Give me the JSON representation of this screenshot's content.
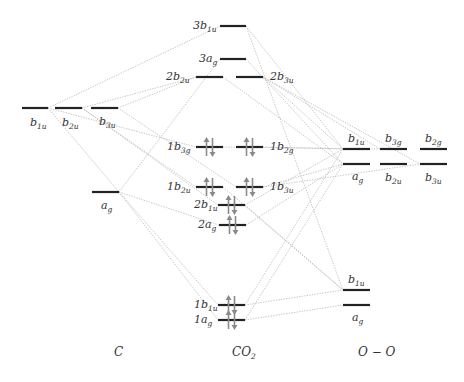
{
  "columns": {
    "left": {
      "title": "C",
      "x": 114,
      "y": 356
    },
    "middle": {
      "title": "CO",
      "title_sub": "2",
      "x": 232,
      "y": 356
    },
    "right": {
      "title": "O − O",
      "x": 358,
      "y": 356
    }
  },
  "levels": [
    {
      "id": "c_b1u",
      "x1": 22,
      "x2": 48,
      "y": 108,
      "label": "b",
      "sub": "1u",
      "lx": 30,
      "ly": 126,
      "electrons": 0
    },
    {
      "id": "c_b2u",
      "x1": 55,
      "x2": 82,
      "y": 108,
      "label": "b",
      "sub": "2u",
      "lx": 62,
      "ly": 126,
      "electrons": 0
    },
    {
      "id": "c_b3u",
      "x1": 91,
      "x2": 118,
      "y": 108,
      "label": "b",
      "sub": "3u",
      "lx": 99,
      "ly": 125,
      "electrons": 0
    },
    {
      "id": "c_ag",
      "x1": 92,
      "x2": 119,
      "y": 192,
      "label": "a",
      "sub": "g",
      "lx": 101,
      "ly": 209,
      "electrons": 0
    },
    {
      "id": "co2_3b1u",
      "x1": 220,
      "x2": 246,
      "y": 26,
      "label": "3b",
      "sub": "1u",
      "lx": 193,
      "ly": 29,
      "electrons": 0
    },
    {
      "id": "co2_3ag",
      "x1": 220,
      "x2": 246,
      "y": 59,
      "label": "3a",
      "sub": "g",
      "lx": 199,
      "ly": 62,
      "electrons": 0
    },
    {
      "id": "co2_2b2u",
      "x1": 196,
      "x2": 223,
      "y": 77,
      "label": "2b",
      "sub": "2u",
      "lx": 166,
      "ly": 80,
      "electrons": 0
    },
    {
      "id": "co2_2b3u",
      "x1": 236,
      "x2": 263,
      "y": 77,
      "label": "2b",
      "sub": "3u",
      "lx": 270,
      "ly": 80,
      "electrons": 0
    },
    {
      "id": "co2_1b3g",
      "x1": 196,
      "x2": 223,
      "y": 147,
      "label": "1b",
      "sub": "3g",
      "lx": 167,
      "ly": 150,
      "electrons": 2
    },
    {
      "id": "co2_1b2g",
      "x1": 236,
      "x2": 263,
      "y": 147,
      "label": "1b",
      "sub": "2g",
      "lx": 270,
      "ly": 150,
      "electrons": 2
    },
    {
      "id": "co2_1b2u",
      "x1": 196,
      "x2": 223,
      "y": 187,
      "label": "1b",
      "sub": "2u",
      "lx": 167,
      "ly": 190,
      "electrons": 2
    },
    {
      "id": "co2_1b3u",
      "x1": 236,
      "x2": 263,
      "y": 187,
      "label": "1b",
      "sub": "3u",
      "lx": 270,
      "ly": 190,
      "electrons": 2
    },
    {
      "id": "co2_2b1u",
      "x1": 218,
      "x2": 245,
      "y": 205,
      "label": "2b",
      "sub": "1u",
      "lx": 194,
      "ly": 208,
      "electrons": 2
    },
    {
      "id": "co2_2ag",
      "x1": 219,
      "x2": 246,
      "y": 225,
      "label": "2a",
      "sub": "g",
      "lx": 198,
      "ly": 228,
      "electrons": 2
    },
    {
      "id": "co2_1b1u",
      "x1": 218,
      "x2": 245,
      "y": 305,
      "label": "1b",
      "sub": "1u",
      "lx": 194,
      "ly": 308,
      "electrons": 2
    },
    {
      "id": "co2_1ag",
      "x1": 218,
      "x2": 245,
      "y": 320,
      "label": "1a",
      "sub": "g",
      "lx": 194,
      "ly": 323,
      "electrons": 2
    },
    {
      "id": "oo_b1u",
      "x1": 343,
      "x2": 370,
      "y": 149,
      "label": "b",
      "sub": "1u",
      "lx": 348,
      "ly": 142,
      "electrons": 0
    },
    {
      "id": "oo_b3g",
      "x1": 380,
      "x2": 407,
      "y": 149,
      "label": "b",
      "sub": "3g",
      "lx": 385,
      "ly": 142,
      "electrons": 0
    },
    {
      "id": "oo_b2g",
      "x1": 420,
      "x2": 447,
      "y": 149,
      "label": "b",
      "sub": "2g",
      "lx": 425,
      "ly": 142,
      "electrons": 0
    },
    {
      "id": "oo_ag",
      "x1": 343,
      "x2": 370,
      "y": 164,
      "label": "a",
      "sub": "g",
      "lx": 352,
      "ly": 180,
      "electrons": 0
    },
    {
      "id": "oo_b2u",
      "x1": 380,
      "x2": 407,
      "y": 164,
      "label": "b",
      "sub": "2u",
      "lx": 385,
      "ly": 181,
      "electrons": 0
    },
    {
      "id": "oo_b3u",
      "x1": 420,
      "x2": 447,
      "y": 164,
      "label": "b",
      "sub": "3u",
      "lx": 425,
      "ly": 181,
      "electrons": 0
    },
    {
      "id": "oo_b1u_low",
      "x1": 343,
      "x2": 370,
      "y": 290,
      "label": "b",
      "sub": "1u",
      "lx": 348,
      "ly": 283,
      "electrons": 0
    },
    {
      "id": "oo_ag_low",
      "x1": 343,
      "x2": 370,
      "y": 305,
      "label": "a",
      "sub": "g",
      "lx": 352,
      "ly": 321,
      "electrons": 0
    }
  ],
  "connections": [
    [
      48,
      108,
      220,
      26
    ],
    [
      82,
      108,
      196,
      77
    ],
    [
      118,
      108,
      196,
      77
    ],
    [
      48,
      108,
      196,
      147
    ],
    [
      82,
      108,
      196,
      187
    ],
    [
      118,
      108,
      236,
      187
    ],
    [
      82,
      108,
      218,
      205
    ],
    [
      48,
      108,
      119,
      192
    ],
    [
      119,
      192,
      220,
      59
    ],
    [
      119,
      192,
      219,
      225
    ],
    [
      119,
      192,
      218,
      305
    ],
    [
      119,
      192,
      218,
      320
    ],
    [
      246,
      26,
      343,
      149
    ],
    [
      246,
      26,
      343,
      290
    ],
    [
      246,
      59,
      343,
      164
    ],
    [
      263,
      77,
      343,
      149
    ],
    [
      223,
      77,
      343,
      164
    ],
    [
      263,
      77,
      380,
      149
    ],
    [
      263,
      77,
      420,
      164
    ],
    [
      263,
      147,
      343,
      149
    ],
    [
      223,
      147,
      380,
      149
    ],
    [
      263,
      187,
      343,
      164
    ],
    [
      263,
      187,
      420,
      164
    ],
    [
      245,
      205,
      343,
      149
    ],
    [
      246,
      225,
      343,
      164
    ],
    [
      245,
      205,
      343,
      290
    ],
    [
      245,
      305,
      343,
      149
    ],
    [
      245,
      320,
      343,
      164
    ],
    [
      245,
      305,
      343,
      290
    ],
    [
      245,
      320,
      343,
      305
    ],
    [
      223,
      187,
      343,
      290
    ]
  ],
  "colors": {
    "level": "#222222",
    "connection": "#b8b8b8",
    "electron_arrow": "#8a8a8a",
    "text": "#333333"
  }
}
